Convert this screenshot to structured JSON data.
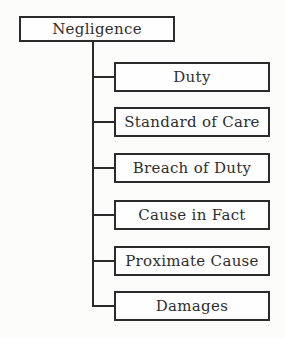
{
  "diagram": {
    "root": {
      "label": "Negligence"
    },
    "children": [
      {
        "label": "Duty"
      },
      {
        "label": "Standard of Care"
      },
      {
        "label": "Breach of Duty"
      },
      {
        "label": "Cause in Fact"
      },
      {
        "label": "Proximate Cause"
      },
      {
        "label": "Damages"
      }
    ],
    "colors": {
      "background": "#fcfcfb",
      "box_fill": "#fefefe",
      "border": "#2b2b2b",
      "line": "#2b2b2b",
      "text": "#2e2e2e"
    }
  }
}
